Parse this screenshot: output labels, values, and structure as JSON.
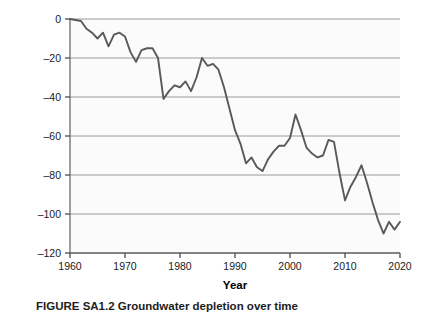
{
  "figure": {
    "caption": "FIGURE SA1.2  Groundwater depletion over time",
    "background_color": "#ffffff",
    "plot_background_color": "#fbfbfb",
    "line_color": "#595959",
    "grid_color": "#9a9a9a",
    "axis_color": "#6b6b6b"
  },
  "axes": {
    "y_title_main": "Cumulative groundwater loss (km",
    "y_title_sup": "3",
    "y_title_close": ")",
    "x_title": "Year",
    "y_ticks": [
      "0",
      "–20",
      "–40",
      "–60",
      "–80",
      "–100",
      "–120"
    ],
    "x_ticks": [
      "1960",
      "1970",
      "1980",
      "1990",
      "2000",
      "2010",
      "2020"
    ]
  },
  "chart_data": {
    "type": "line",
    "title": "",
    "subtitle": "",
    "xlabel": "Year",
    "ylabel": "Cumulative groundwater loss (km3)",
    "xlim": [
      1960,
      2020
    ],
    "ylim": [
      -120,
      0
    ],
    "grid": true,
    "grid_axis": "y",
    "legend": false,
    "legend_position": "none",
    "y_ticks": [
      0,
      -20,
      -40,
      -60,
      -80,
      -100,
      -120
    ],
    "x_ticks": [
      1960,
      1970,
      1980,
      1990,
      2000,
      2010,
      2020
    ],
    "series": [
      {
        "name": "Cumulative groundwater loss",
        "color": "#595959",
        "x": [
          1960,
          1961,
          1962,
          1963,
          1964,
          1965,
          1966,
          1967,
          1968,
          1969,
          1970,
          1971,
          1972,
          1973,
          1974,
          1975,
          1976,
          1977,
          1978,
          1979,
          1980,
          1981,
          1982,
          1983,
          1984,
          1985,
          1986,
          1987,
          1988,
          1989,
          1990,
          1991,
          1992,
          1993,
          1994,
          1995,
          1996,
          1997,
          1998,
          1999,
          2000,
          2001,
          2002,
          2003,
          2004,
          2005,
          2006,
          2007,
          2008,
          2009,
          2010,
          2011,
          2012,
          2013,
          2014,
          2015,
          2016,
          2017,
          2018,
          2019,
          2020
        ],
        "values": [
          0,
          -0.5,
          -1,
          -5,
          -7,
          -10,
          -7,
          -14,
          -8,
          -7,
          -9,
          -17,
          -22,
          -16,
          -15,
          -15,
          -20,
          -41,
          -37,
          -34,
          -35,
          -32,
          -37,
          -30,
          -20,
          -24,
          -23,
          -26,
          -35,
          -46,
          -57,
          -64,
          -74,
          -71,
          -76,
          -78,
          -72,
          -68,
          -65,
          -65,
          -61,
          -49,
          -57,
          -66,
          -69,
          -71,
          -70,
          -62,
          -63,
          -79,
          -93,
          -86,
          -81,
          -75,
          -84,
          -94,
          -103,
          -110,
          -104,
          -108,
          -104
        ]
      }
    ]
  }
}
